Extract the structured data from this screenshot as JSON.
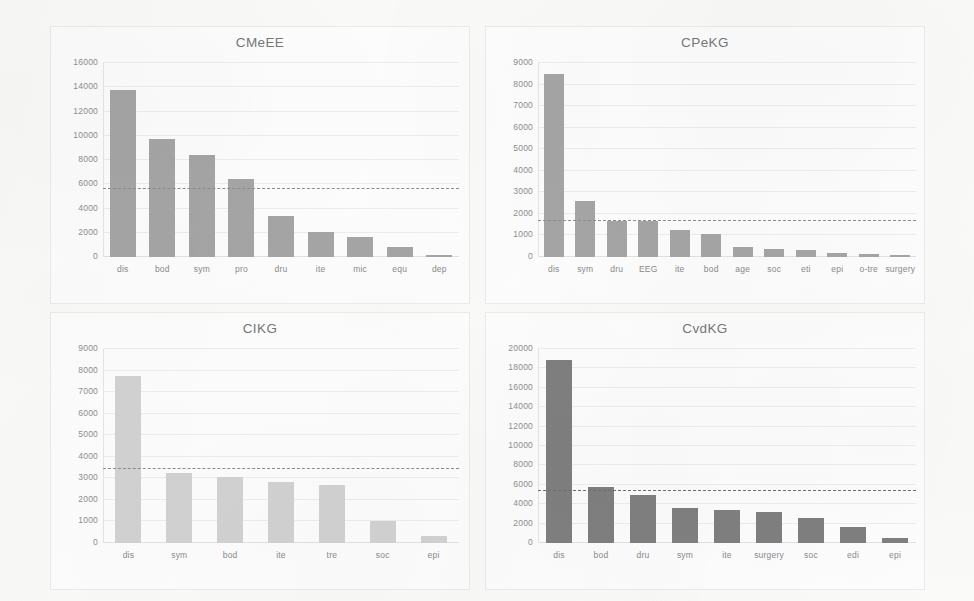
{
  "figure": {
    "background_color": "#fbfbfa",
    "panel_color": "#fefefe"
  },
  "charts": [
    {
      "id": "cmeee",
      "title": "CMeEE",
      "type": "bar",
      "categories": [
        "dis",
        "bod",
        "sym",
        "pro",
        "dru",
        "ite",
        "mic",
        "equ",
        "dep"
      ],
      "values": [
        13800,
        9750,
        8400,
        6400,
        3400,
        2050,
        1650,
        850,
        200
      ],
      "yticks": [
        0,
        2000,
        4000,
        6000,
        8000,
        10000,
        12000,
        14000,
        16000
      ],
      "ylim": [
        0,
        16000
      ],
      "mean_line": 5600,
      "bar_color": "#a6a6a6",
      "mean_line_color": "#8d8d8f",
      "xlabel": "",
      "ylabel": "",
      "grid": true
    },
    {
      "id": "cpekg",
      "title": "CPeKG",
      "type": "bar",
      "categories": [
        "dis",
        "sym",
        "dru",
        "EEG",
        "ite",
        "bod",
        "age",
        "soc",
        "eti",
        "epi",
        "o-tre",
        "surgery"
      ],
      "values": [
        8500,
        2620,
        1680,
        1680,
        1270,
        1050,
        450,
        350,
        330,
        180,
        120,
        80
      ],
      "yticks": [
        0,
        1000,
        2000,
        3000,
        4000,
        5000,
        6000,
        7000,
        8000,
        9000
      ],
      "ylim": [
        0,
        9000
      ],
      "mean_line": 1680,
      "bar_color": "#a6a6a6",
      "mean_line_color": "#8d8d8f",
      "xlabel": "",
      "ylabel": "",
      "grid": true
    },
    {
      "id": "cikg",
      "title": "CIKG",
      "type": "bar",
      "categories": [
        "dis",
        "sym",
        "bod",
        "ite",
        "tre",
        "soc",
        "epi"
      ],
      "values": [
        7750,
        3250,
        3050,
        2850,
        2700,
        1000,
        330
      ],
      "yticks": [
        0,
        1000,
        2000,
        3000,
        4000,
        5000,
        6000,
        7000,
        8000,
        9000
      ],
      "ylim": [
        0,
        9000
      ],
      "mean_line": 3450,
      "bar_color": "#d3d3d3",
      "mean_line_color": "#8d8d8f",
      "xlabel": "",
      "ylabel": "",
      "grid": true
    },
    {
      "id": "cvdkg",
      "title": "CvdKG",
      "type": "bar",
      "categories": [
        "dis",
        "bod",
        "dru",
        "sym",
        "ite",
        "surgery",
        "soc",
        "edi",
        "epi"
      ],
      "values": [
        18900,
        5750,
        4900,
        3650,
        3450,
        3200,
        2550,
        1650,
        550
      ],
      "yticks": [
        0,
        2000,
        4000,
        6000,
        8000,
        10000,
        12000,
        14000,
        16000,
        18000,
        20000
      ],
      "ylim": [
        0,
        20000
      ],
      "mean_line": 5350,
      "bar_color": "#808080",
      "mean_line_color": "#6f6f71",
      "xlabel": "",
      "ylabel": "",
      "grid": true
    }
  ],
  "chart_data": [
    {
      "type": "bar",
      "title": "CMeEE",
      "categories": [
        "dis",
        "bod",
        "sym",
        "pro",
        "dru",
        "ite",
        "mic",
        "equ",
        "dep"
      ],
      "values": [
        13800,
        9750,
        8400,
        6400,
        3400,
        2050,
        1650,
        850,
        200
      ],
      "xlabel": "",
      "ylabel": "",
      "ylim": [
        0,
        16000
      ],
      "yticks": [
        0,
        2000,
        4000,
        6000,
        8000,
        10000,
        12000,
        14000,
        16000
      ],
      "annotations": [
        {
          "kind": "hline",
          "label": "mean",
          "value": 5600,
          "style": "dashed"
        }
      ],
      "grid": true,
      "legend": "none"
    },
    {
      "type": "bar",
      "title": "CPeKG",
      "categories": [
        "dis",
        "sym",
        "dru",
        "EEG",
        "ite",
        "bod",
        "age",
        "soc",
        "eti",
        "epi",
        "o-tre",
        "surgery"
      ],
      "values": [
        8500,
        2620,
        1680,
        1680,
        1270,
        1050,
        450,
        350,
        330,
        180,
        120,
        80
      ],
      "xlabel": "",
      "ylabel": "",
      "ylim": [
        0,
        9000
      ],
      "yticks": [
        0,
        1000,
        2000,
        3000,
        4000,
        5000,
        6000,
        7000,
        8000,
        9000
      ],
      "annotations": [
        {
          "kind": "hline",
          "label": "mean",
          "value": 1680,
          "style": "dashed"
        }
      ],
      "grid": true,
      "legend": "none"
    },
    {
      "type": "bar",
      "title": "CIKG",
      "categories": [
        "dis",
        "sym",
        "bod",
        "ite",
        "tre",
        "soc",
        "epi"
      ],
      "values": [
        7750,
        3250,
        3050,
        2850,
        2700,
        1000,
        330
      ],
      "xlabel": "",
      "ylabel": "",
      "ylim": [
        0,
        9000
      ],
      "yticks": [
        0,
        1000,
        2000,
        3000,
        4000,
        5000,
        6000,
        7000,
        8000,
        9000
      ],
      "annotations": [
        {
          "kind": "hline",
          "label": "mean",
          "value": 3450,
          "style": "dashed"
        }
      ],
      "grid": true,
      "legend": "none"
    },
    {
      "type": "bar",
      "title": "CvdKG",
      "categories": [
        "dis",
        "bod",
        "dru",
        "sym",
        "ite",
        "surgery",
        "soc",
        "edi",
        "epi"
      ],
      "values": [
        18900,
        5750,
        4900,
        3650,
        3450,
        3200,
        2550,
        1650,
        550
      ],
      "xlabel": "",
      "ylabel": "",
      "ylim": [
        0,
        20000
      ],
      "yticks": [
        0,
        2000,
        4000,
        6000,
        8000,
        10000,
        12000,
        14000,
        16000,
        18000,
        20000
      ],
      "annotations": [
        {
          "kind": "hline",
          "label": "mean",
          "value": 5350,
          "style": "dashed"
        }
      ],
      "grid": true,
      "legend": "none"
    }
  ]
}
